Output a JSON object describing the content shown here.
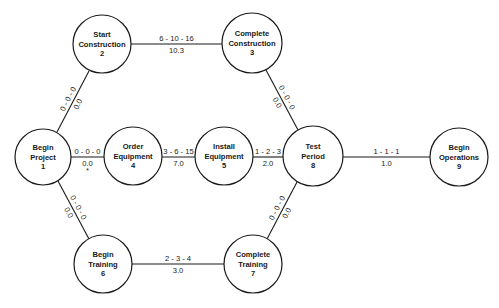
{
  "diagram": {
    "type": "PERT network",
    "colors": {
      "line": "#1a1a1a",
      "background": "#ffffff"
    },
    "nodes": [
      {
        "id": "1",
        "lines": [
          "Begin",
          "Project",
          "1"
        ],
        "cx": 43,
        "cy": 157,
        "r": 28
      },
      {
        "id": "2",
        "lines": [
          "Start",
          "Construction",
          "2"
        ],
        "cx": 102,
        "cy": 44,
        "r": 29
      },
      {
        "id": "3",
        "lines": [
          "Complete",
          "Construction",
          "3"
        ],
        "cx": 252,
        "cy": 43,
        "r": 30
      },
      {
        "id": "4",
        "lines": [
          "Order",
          "Equipment",
          "4"
        ],
        "cx": 133,
        "cy": 156,
        "r": 29
      },
      {
        "id": "5",
        "lines": [
          "Install",
          "Equipment",
          "5"
        ],
        "cx": 224,
        "cy": 156,
        "r": 29
      },
      {
        "id": "6",
        "lines": [
          "Begin",
          "Training",
          "6"
        ],
        "cx": 103,
        "cy": 264,
        "r": 29
      },
      {
        "id": "7",
        "lines": [
          "Complete",
          "Training",
          "7"
        ],
        "cx": 253,
        "cy": 264,
        "r": 29
      },
      {
        "id": "8",
        "lines": [
          "Test",
          "Period",
          "8"
        ],
        "cx": 313,
        "cy": 156,
        "r": 30
      },
      {
        "id": "9",
        "lines": [
          "Begin",
          "Operations",
          "9"
        ],
        "cx": 459,
        "cy": 157,
        "r": 29
      }
    ],
    "edges": [
      {
        "from": "1",
        "to": "2",
        "estimates": "0 - 0 - 0",
        "expected": "0.0",
        "x1": 57,
        "y1": 132,
        "x2": 89,
        "y2": 71,
        "orientation": "diagonal"
      },
      {
        "from": "2",
        "to": "3",
        "estimates": "6 - 10 - 16",
        "expected": "10.3",
        "x1": 131,
        "y1": 44,
        "x2": 222,
        "y2": 44,
        "orientation": "horizontal"
      },
      {
        "from": "1",
        "to": "4",
        "estimates": "0 - 0 - 0",
        "expected": "0.0",
        "marker": "*",
        "x1": 71,
        "y1": 157,
        "x2": 104,
        "y2": 157,
        "orientation": "horizontal"
      },
      {
        "from": "4",
        "to": "5",
        "estimates": "3 - 6 - 15",
        "expected": "7.0",
        "x1": 162,
        "y1": 157,
        "x2": 195,
        "y2": 157,
        "orientation": "horizontal"
      },
      {
        "from": "5",
        "to": "8",
        "estimates": "1 - 2 - 3",
        "expected": "2.0",
        "x1": 253,
        "y1": 157,
        "x2": 283,
        "y2": 157,
        "orientation": "horizontal"
      },
      {
        "from": "3",
        "to": "8",
        "estimates": "0 - 0 - 0",
        "expected": "0.0",
        "x1": 266,
        "y1": 70,
        "x2": 298,
        "y2": 130,
        "orientation": "diagonal"
      },
      {
        "from": "1",
        "to": "6",
        "estimates": "0 - 0 - 0",
        "expected": "0.0",
        "x1": 58,
        "y1": 181,
        "x2": 89,
        "y2": 239,
        "orientation": "diagonal"
      },
      {
        "from": "6",
        "to": "7",
        "estimates": "2 - 3 - 4",
        "expected": "3.0",
        "x1": 132,
        "y1": 264,
        "x2": 224,
        "y2": 264,
        "orientation": "horizontal"
      },
      {
        "from": "7",
        "to": "8",
        "estimates": "0 - 0 - 0",
        "expected": "0.0",
        "x1": 267,
        "y1": 239,
        "x2": 297,
        "y2": 182,
        "orientation": "diagonal"
      },
      {
        "from": "8",
        "to": "9",
        "estimates": "1 - 1 - 1",
        "expected": "1.0",
        "x1": 343,
        "y1": 157,
        "x2": 430,
        "y2": 157,
        "orientation": "horizontal"
      }
    ]
  }
}
